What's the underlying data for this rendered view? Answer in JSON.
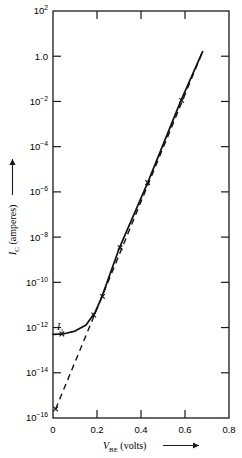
{
  "chart_data": {
    "type": "line",
    "title": "",
    "xlabel": "V_BE (volts)",
    "ylabel": "I_C (amperes)",
    "xlim": [
      0,
      0.8
    ],
    "ylim": [
      1e-16,
      100
    ],
    "yscale": "log",
    "grid": false,
    "legend": null,
    "annotations": [
      {
        "text": "I_1",
        "x": 0.02,
        "y": 3e-13,
        "note": "leakage floor current label"
      }
    ],
    "series": [
      {
        "name": "measured collector current",
        "style": "solid",
        "marker": "x",
        "x": [
          0.0,
          0.05,
          0.1,
          0.15,
          0.19,
          0.22,
          0.3,
          0.43,
          0.58,
          0.68
        ],
        "y": [
          5e-13,
          5.3e-13,
          7e-13,
          1.3e-12,
          4.5e-12,
          2e-11,
          3e-09,
          2.5e-06,
          0.01,
          1.6
        ]
      },
      {
        "name": "ideal exponential extrapolation",
        "style": "dashed",
        "marker": "x",
        "x": [
          0.012,
          0.22,
          0.68
        ],
        "y": [
          2.5e-16,
          2e-11,
          1.6
        ]
      }
    ],
    "markers": [
      {
        "x": 0.012,
        "y": 2.5e-16
      },
      {
        "x": 0.04,
        "y": 5.2e-13
      },
      {
        "x": 0.185,
        "y": 3.6e-12
      },
      {
        "x": 0.225,
        "y": 2.4e-11
      },
      {
        "x": 0.305,
        "y": 3.4e-09
      },
      {
        "x": 0.43,
        "y": 2.6e-06
      },
      {
        "x": 0.585,
        "y": 0.011
      }
    ],
    "x_ticks": [
      {
        "value": 0,
        "label": "0"
      },
      {
        "value": 0.2,
        "label": "0.2"
      },
      {
        "value": 0.4,
        "label": "0.4"
      },
      {
        "value": 0.6,
        "label": "0.6"
      },
      {
        "value": 0.8,
        "label": "0.8"
      }
    ],
    "y_ticks": [
      {
        "value": 100.0,
        "mantissa": "10",
        "exponent": "2"
      },
      {
        "value": 1.0,
        "mantissa": "1.0",
        "exponent": ""
      },
      {
        "value": 0.01,
        "mantissa": "10",
        "exponent": "−2"
      },
      {
        "value": 0.0001,
        "mantissa": "10",
        "exponent": "−4"
      },
      {
        "value": 1e-06,
        "mantissa": "10",
        "exponent": "−6"
      },
      {
        "value": 1e-08,
        "mantissa": "10",
        "exponent": "−8"
      },
      {
        "value": 1e-10,
        "mantissa": "10",
        "exponent": "−10"
      },
      {
        "value": 1e-12,
        "mantissa": "10",
        "exponent": "−12"
      },
      {
        "value": 1e-14,
        "mantissa": "10",
        "exponent": "−14"
      },
      {
        "value": 1e-16,
        "mantissa": "10",
        "exponent": "−16"
      }
    ],
    "colors": {
      "axis": "#1a1a1a",
      "curve": "#111111",
      "background": "#ffffff"
    }
  },
  "labels": {
    "y_axis_symbol": "I",
    "y_axis_subscript": "C",
    "y_axis_units": "(amperes)",
    "y_axis_arrow": "↑",
    "x_axis_symbol": "V",
    "x_axis_subscript": "BE",
    "x_axis_units": "(volts)",
    "x_axis_arrow": "⟶",
    "i_one_symbol": "I",
    "i_one_subscript": "1"
  }
}
